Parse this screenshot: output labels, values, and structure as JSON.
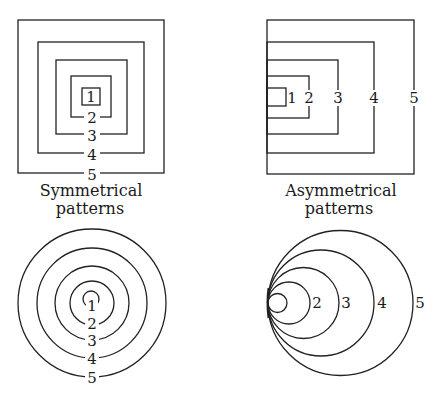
{
  "panels": {
    "symmetrical_squares": {
      "labels": [
        "1",
        "2",
        "3",
        "4",
        "5"
      ]
    },
    "asymmetrical_squares": {
      "labels": [
        "1",
        "2",
        "3",
        "4",
        "5"
      ]
    },
    "symmetrical_circles": {
      "labels": [
        "1",
        "2",
        "3",
        "4",
        "5"
      ]
    },
    "asymmetrical_circles": {
      "labels": [
        "2",
        "3",
        "4",
        "5"
      ]
    }
  },
  "captions": {
    "symmetrical": {
      "line1": "Symmetrical",
      "line2": "patterns"
    },
    "asymmetrical": {
      "line1": "Asymmetrical",
      "line2": "patterns"
    }
  },
  "colors": {
    "stroke": "#222222",
    "background": "#ffffff"
  }
}
